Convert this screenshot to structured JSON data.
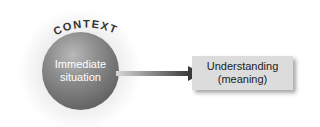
{
  "context": {
    "label": "CONTEXT"
  },
  "sphere": {
    "line1": "Immediate",
    "line2": "situation"
  },
  "result_box": {
    "line1": "Understanding",
    "line2": "(meaning)"
  },
  "colors": {
    "sphere": "#8d8d8d",
    "box": "#dcdcdc",
    "arrow": "#444444"
  }
}
